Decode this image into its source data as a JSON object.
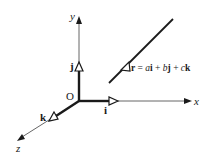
{
  "diagram": {
    "type": "3d-coordinate-axes-with-line",
    "axes": {
      "x": {
        "label": "x"
      },
      "y": {
        "label": "y"
      },
      "z": {
        "label": "z"
      }
    },
    "origin": {
      "label": "O"
    },
    "unit_vectors": {
      "i": {
        "label": "i"
      },
      "j": {
        "label": "j"
      },
      "k": {
        "label": "k"
      }
    },
    "line": {
      "equation_parts": {
        "r": "r",
        "eq": " = ",
        "a": "a",
        "i": "i",
        "plus1": " + ",
        "b": "b",
        "j": "j",
        "plus2": " + ",
        "c": "c",
        "k": "k"
      }
    },
    "colors": {
      "stroke": "#1a1a1a",
      "axis": "#444444",
      "background": "#ffffff"
    }
  }
}
